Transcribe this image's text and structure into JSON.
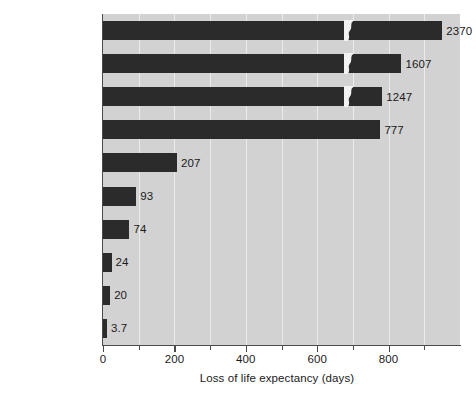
{
  "chart_data": {
    "type": "bar",
    "orientation": "horizontal",
    "title": "",
    "xlabel": "Loss of life expectancy (days)",
    "ylabel": "",
    "xlim": [
      0,
      1000
    ],
    "xticks": [
      0,
      200,
      400,
      600,
      800
    ],
    "xtick_labels": [
      "0",
      "200",
      "400",
      "600",
      "800"
    ],
    "minor_xticks": [
      100,
      300,
      500,
      700,
      900
    ],
    "grid": true,
    "grid_axis": "x",
    "legend": null,
    "axis_broken": true,
    "break_note": "Three longest bars are drawn with an axis-break squiggle; their true values exceed the plotted axis range.",
    "categories": [
      "Smoking 20 cigarettes a day",
      "Heart disease",
      "Cancer",
      "Overweight by 15%",
      "Automobile accident",
      "Homicide",
      "Home accident",
      "Drowning",
      "Fire",
      "Airplane accident"
    ],
    "values": [
      2370,
      1607,
      1247,
      777,
      207,
      93,
      74,
      24,
      20,
      3.7
    ],
    "value_labels": [
      "2370",
      "1607",
      "1247",
      "777",
      "207",
      "93",
      "74",
      "24",
      "20",
      "3.7"
    ],
    "bars": [
      {
        "label_line1": "Smoking 20",
        "label_line2": "cigarettes a day",
        "value": 2370,
        "value_label": "2370",
        "plotted_end": 950,
        "broken": true,
        "break_at": 690
      },
      {
        "label_line1": "Heart",
        "label_line2": "disease",
        "value": 1607,
        "value_label": "1607",
        "plotted_end": 836,
        "broken": true,
        "break_at": 690
      },
      {
        "label_line1": "Cancer",
        "label_line2": "",
        "value": 1247,
        "value_label": "1247",
        "plotted_end": 782,
        "broken": true,
        "break_at": 690
      },
      {
        "label_line1": "Overweight",
        "label_line2": "by 15%",
        "value": 777,
        "value_label": "777",
        "plotted_end": 777,
        "broken": false,
        "break_at": 0
      },
      {
        "label_line1": "Automobile",
        "label_line2": "accident",
        "value": 207,
        "value_label": "207",
        "plotted_end": 207,
        "broken": false,
        "break_at": 0
      },
      {
        "label_line1": "Homicide",
        "label_line2": "",
        "value": 93,
        "value_label": "93",
        "plotted_end": 93,
        "broken": false,
        "break_at": 0
      },
      {
        "label_line1": "Home",
        "label_line2": "accident",
        "value": 74,
        "value_label": "74",
        "plotted_end": 74,
        "broken": false,
        "break_at": 0
      },
      {
        "label_line1": "Drowning",
        "label_line2": "",
        "value": 24,
        "value_label": "24",
        "plotted_end": 24,
        "broken": false,
        "break_at": 0
      },
      {
        "label_line1": "Fire",
        "label_line2": "",
        "value": 20,
        "value_label": "20",
        "plotted_end": 20,
        "broken": false,
        "break_at": 0
      },
      {
        "label_line1": "Airplane",
        "label_line2": "accident",
        "value": 3.7,
        "value_label": "3.7",
        "plotted_end": 3.7,
        "broken": false,
        "break_at": 0
      }
    ],
    "colors": {
      "bar": "#2b2b2b",
      "plot_background": "#d2d2d2",
      "figure_background": "#ffffff",
      "gridline": "#eceaea",
      "axis": "#4a4a4a",
      "text": "#1a1a1a"
    }
  }
}
